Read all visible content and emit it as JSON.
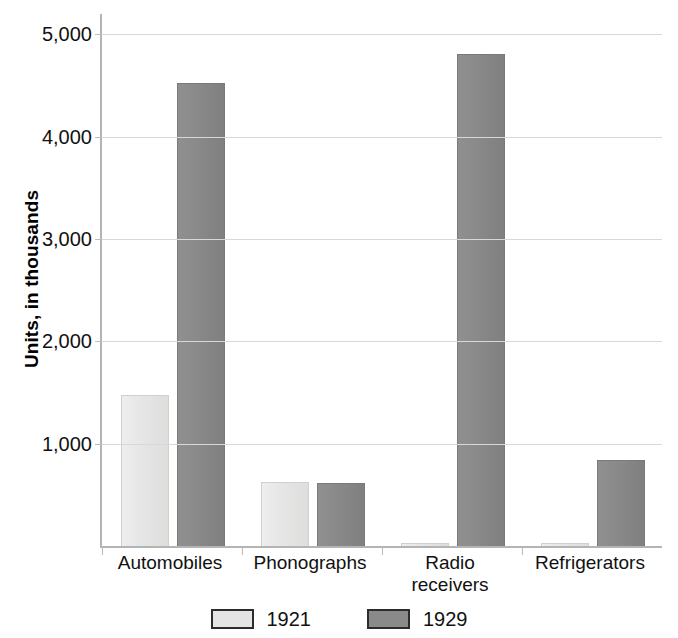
{
  "chart_data": {
    "type": "bar",
    "title": "",
    "subtitle": "",
    "xlabel": "",
    "ylabel": "Units, in thousands",
    "categories": [
      "Automobiles",
      "Phonographs",
      "Radio receivers",
      "Refrigerators"
    ],
    "category_label_lines": [
      [
        "Automobiles"
      ],
      [
        "Phonographs"
      ],
      [
        "Radio",
        "receivers"
      ],
      [
        "Refrigerators"
      ]
    ],
    "series": [
      {
        "name": "1921",
        "color": "#e4e4e4",
        "values": [
          1470,
          620,
          5,
          5
        ]
      },
      {
        "name": "1929",
        "color": "#8a8a8a",
        "values": [
          4520,
          610,
          4800,
          830
        ]
      }
    ],
    "ylim": [
      0,
      5200
    ],
    "yticks": [
      1000,
      2000,
      3000,
      4000,
      5000
    ],
    "ytick_labels": [
      "1,000",
      "2,000",
      "3,000",
      "4,000",
      "5,000"
    ],
    "grid": true,
    "legend_position": "bottom",
    "legend": [
      "1921",
      "1929"
    ]
  },
  "axis": {
    "y_title": "Units, in thousands"
  }
}
